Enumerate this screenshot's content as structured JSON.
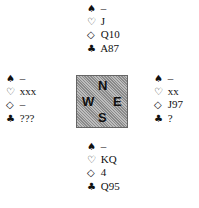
{
  "symbols": {
    "spade": "♠",
    "heart": "♡",
    "diamond": "◇",
    "club": "♣"
  },
  "hands": {
    "north": {
      "spades": "–",
      "hearts": "J",
      "diamonds": "Q10",
      "clubs": "A87"
    },
    "west": {
      "spades": "–",
      "hearts": "xxx",
      "diamonds": "–",
      "clubs": "???"
    },
    "east": {
      "spades": "–",
      "hearts": "xx",
      "diamonds": "J97",
      "clubs": "?"
    },
    "south": {
      "spades": "–",
      "hearts": "KQ",
      "diamonds": "4",
      "clubs": "Q95"
    }
  },
  "compass": {
    "n": "N",
    "w": "W",
    "e": "E",
    "s": "S"
  }
}
